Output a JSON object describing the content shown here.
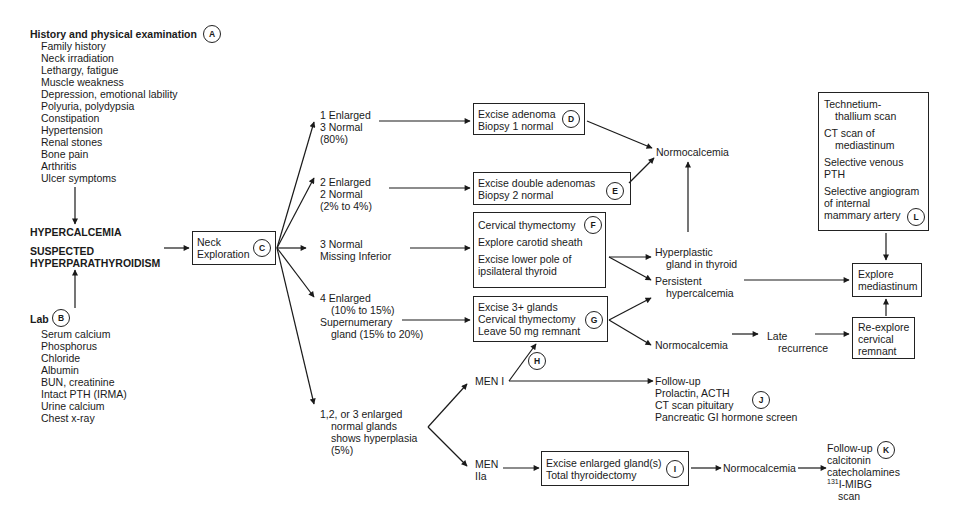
{
  "history": {
    "title": "History and physical examination",
    "label": "A",
    "items": [
      "Family history",
      "Neck irradiation",
      "Lethargy, fatigue",
      "Muscle weakness",
      "Depression, emotional lability",
      "Polyuria, polydypsia",
      "Constipation",
      "Hypertension",
      "Renal stones",
      "Bone pain",
      "Arthritis",
      "Ulcer symptoms"
    ]
  },
  "center": {
    "hypercalcemia": "HYPERCALCEMIA",
    "suspected_line1": "SUSPECTED",
    "suspected_line2": "HYPERPARATHYROIDISM"
  },
  "lab": {
    "title": "Lab",
    "label": "B",
    "items": [
      "Serum calcium",
      "Phosphorus",
      "Chloride",
      "Albumin",
      "BUN, creatinine",
      "Intact PTH (IRMA)",
      "Urine calcium",
      "Chest x-ray"
    ]
  },
  "neck": {
    "line1": "Neck",
    "line2": "Exploration",
    "label": "C"
  },
  "findings": {
    "f1": [
      "1 Enlarged",
      "3 Normal",
      "(80%)"
    ],
    "f2": [
      "2 Enlarged",
      "2 Normal",
      "(2% to 4%)"
    ],
    "f3": [
      "3 Normal",
      "Missing Inferior"
    ],
    "f4": [
      "4 Enlarged",
      "(10% to 15%)",
      "Supernumerary",
      "gland (15% to 20%)"
    ],
    "f5": [
      "1,2, or 3 enlarged",
      "normal glands",
      "shows hyperplasia",
      "(5%)"
    ]
  },
  "box_d": {
    "lines": [
      "Excise adenoma",
      "Biopsy 1 normal"
    ],
    "label": "D"
  },
  "box_e": {
    "lines": [
      "Excise double adenomas",
      "Biopsy 2 normal"
    ],
    "label": "E"
  },
  "box_f": {
    "lines": [
      "Cervical thymectomy",
      "Explore carotid sheath",
      "Excise lower pole of",
      "ipsilateral thyroid"
    ],
    "label": "F"
  },
  "box_g": {
    "lines": [
      "Excise 3+ glands",
      "Cervical thymectomy",
      "Leave 50 mg remnant"
    ],
    "label": "G"
  },
  "men": {
    "men1": "MEN I",
    "men2a_1": "MEN",
    "men2a_2": "IIa",
    "label_h": "H"
  },
  "box_i": {
    "lines": [
      "Excise enlarged gland(s)",
      "Total thyroidectomy"
    ],
    "label": "I"
  },
  "outcomes": {
    "normocalcemia_top": "Normocalcemia",
    "hyperplastic": [
      "Hyperplastic",
      "gland in thyroid"
    ],
    "persistent": [
      "Persistent",
      "hypercalcemia"
    ],
    "normocalcemia_mid": "Normocalcemia",
    "late": [
      "Late",
      "recurrence"
    ],
    "normocalcemia_bot": "Normocalcemia"
  },
  "followup_j": {
    "lines": [
      "Follow-up",
      "Prolactin, ACTH",
      "CT scan pituitary",
      "Pancreatic GI hormone screen"
    ],
    "label": "J"
  },
  "followup_k": {
    "lines": [
      "Follow-up",
      "calcitonin",
      "catecholamines",
      "I-MIBG",
      "scan"
    ],
    "sup": "131",
    "label": "K"
  },
  "box_l": {
    "items": [
      [
        "Technetium-",
        "thallium scan"
      ],
      [
        "CT scan of",
        "mediastinum"
      ],
      [
        "Selective venous",
        "PTH"
      ],
      [
        "Selective angiogram",
        "of internal",
        "mammary artery"
      ]
    ],
    "label": "L"
  },
  "explore_med": [
    "Explore",
    "mediastinum"
  ],
  "reexplore": [
    "Re-explore",
    "cervical",
    "remnant"
  ]
}
